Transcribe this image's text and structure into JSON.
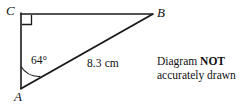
{
  "diagram": {
    "type": "right-triangle",
    "stroke_color": "#1a1a1a",
    "background_color": "#ffffff",
    "vertices": [
      {
        "name": "C",
        "label": "C",
        "x": 21,
        "y": 14,
        "label_x": 6,
        "label_y": 4
      },
      {
        "name": "B",
        "label": "B",
        "x": 152,
        "y": 14,
        "label_x": 157,
        "label_y": 6
      },
      {
        "name": "A",
        "label": "A",
        "x": 21,
        "y": 88,
        "label_x": 14,
        "label_y": 90
      }
    ],
    "edges": [
      {
        "name": "side-CB",
        "from": "C",
        "to": "B"
      },
      {
        "name": "side-CA",
        "from": "C",
        "to": "A"
      },
      {
        "name": "side-AB-hypotenuse",
        "from": "A",
        "to": "B"
      }
    ],
    "right_angle": {
      "at": "C",
      "marker": "square",
      "size": 9
    },
    "angle_marker": {
      "at": "A",
      "value": "64°",
      "radius": 22
    },
    "measurements": {
      "angle_label": "64°",
      "side_label": "8.3 cm"
    }
  },
  "note": {
    "line1_prefix": "Diagram ",
    "line1_emphasis": "NOT",
    "line2": "accurately drawn"
  }
}
